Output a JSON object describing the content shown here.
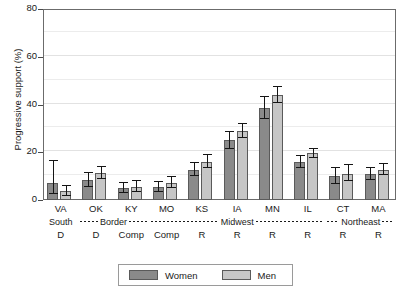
{
  "chart_data": {
    "type": "bar",
    "title": "",
    "xlabel": "",
    "ylabel": "Progressive support (%)",
    "ylim": [
      0,
      80
    ],
    "yticks": [
      0,
      20,
      40,
      60,
      80
    ],
    "grid": true,
    "legend_position": "bottom",
    "categories": [
      "VA",
      "OK",
      "KY",
      "MO",
      "KS",
      "IA",
      "MN",
      "IL",
      "CT",
      "MA"
    ],
    "group_region": [
      "South",
      "Border",
      "Border",
      "Midwest",
      "Midwest",
      "Midwest",
      "Midwest",
      "Midwest",
      "Northeast",
      "Northeast"
    ],
    "party": [
      "D",
      "D",
      "Comp",
      "Comp",
      "R",
      "R",
      "R",
      "R",
      "R",
      "R"
    ],
    "series": [
      {
        "name": "Women",
        "color": "#8a8a8a",
        "values": [
          7.2,
          8.5,
          5.0,
          5.5,
          12.5,
          25.0,
          38.5,
          16.0,
          10.0,
          11.0
        ],
        "err_low": [
          2.5,
          5.5,
          3.0,
          3.5,
          10.0,
          21.5,
          34.0,
          13.5,
          6.5,
          8.5
        ],
        "err_high": [
          16.5,
          11.5,
          7.0,
          7.5,
          15.5,
          28.5,
          43.0,
          18.5,
          13.5,
          13.5
        ]
      },
      {
        "name": "Men",
        "color": "#c6c6c6",
        "values": [
          3.8,
          11.5,
          5.5,
          7.0,
          16.0,
          29.0,
          44.0,
          19.5,
          11.0,
          12.5
        ],
        "err_low": [
          1.5,
          9.0,
          3.5,
          5.0,
          13.5,
          26.0,
          40.5,
          17.5,
          8.0,
          10.5
        ],
        "err_high": [
          6.0,
          14.0,
          8.0,
          9.5,
          19.0,
          32.0,
          47.5,
          21.5,
          14.5,
          15.0
        ]
      }
    ]
  },
  "axis": {
    "y_title": "Progressive support (%)",
    "y_tick_labels": [
      "80",
      "60",
      "40",
      "20",
      "0"
    ]
  },
  "x_axis": {
    "names": [
      "VA",
      "OK",
      "KY",
      "MO",
      "KS",
      "IA",
      "MN",
      "IL",
      "CT",
      "MA"
    ],
    "party_row": [
      "D",
      "D",
      "Comp",
      "Comp",
      "R",
      "R",
      "R",
      "R",
      "R",
      "R"
    ],
    "regions": [
      {
        "label": "South",
        "leading_dashes": false,
        "trailing_dashes": false
      },
      {
        "label": "Border",
        "leading_dashes": true,
        "trailing_dashes": true
      },
      {
        "label": "Midwest",
        "leading_dashes": true,
        "trailing_dashes": true
      },
      {
        "label": "Northeast",
        "leading_dashes": true,
        "trailing_dashes": true
      }
    ]
  },
  "legend": {
    "items": [
      {
        "label": "Women",
        "color": "#8a8a8a"
      },
      {
        "label": "Men",
        "color": "#c6c6c6"
      }
    ]
  }
}
